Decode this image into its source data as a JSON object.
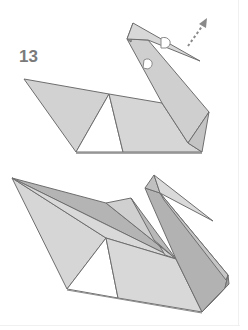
{
  "diagram": {
    "step_number": "13",
    "panels": [
      {
        "name": "swan-step-13-fold",
        "note": "Head tip folded with arrow indicating pull-out direction"
      },
      {
        "name": "swan-finished",
        "note": "Completed origami swan"
      }
    ],
    "colors": {
      "paper_light": "#dcdcdc",
      "paper_mid": "#c8c8c8",
      "paper_dark": "#a9a9a9",
      "stroke": "#6e6e6e",
      "arrow": "#8a8a8a",
      "step_number": "#7a7a7a"
    }
  }
}
